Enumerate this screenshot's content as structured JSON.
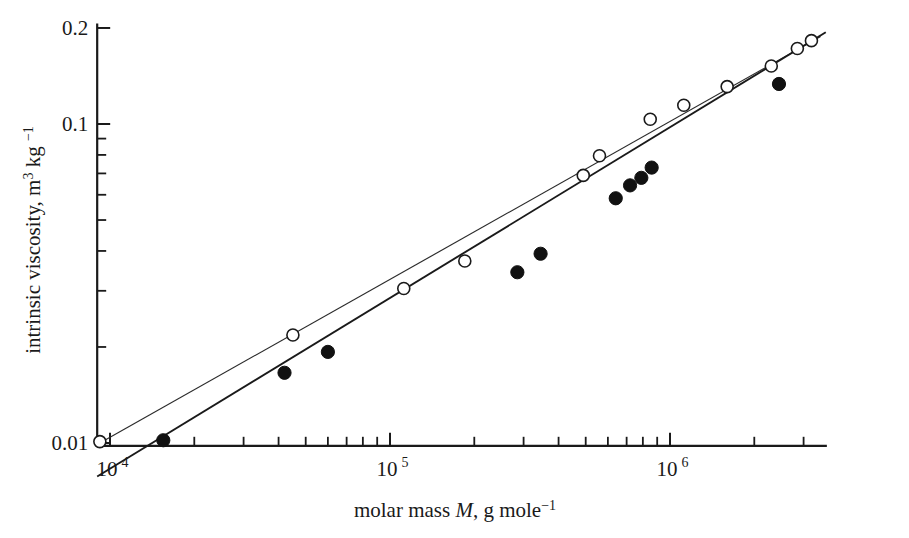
{
  "chart_data": {
    "type": "scatter",
    "title": "",
    "xlabel": "molar mass M, g mole⁻¹",
    "xlabel_parts": {
      "pre": "molar mass ",
      "symbol": "M",
      "mid": ", g mole",
      "sup": "−1"
    },
    "ylabel": "intrinsic viscosity, m³ kg ⁻¹",
    "ylabel_parts": {
      "pre": "intrinsic viscosity, m",
      "sup1": "3",
      "mid": " kg ",
      "sup2": "−1"
    },
    "xscale": "log",
    "yscale": "log",
    "xlim": [
      9000,
      3600000
    ],
    "ylim": [
      0.0098,
      0.205
    ],
    "grid": false,
    "legend": null,
    "x_tick_labels": [
      {
        "value": 10000,
        "text": "10",
        "sup": "4"
      },
      {
        "value": 100000,
        "text": "10",
        "sup": "5"
      },
      {
        "value": 1000000,
        "text": "10",
        "sup": "6"
      }
    ],
    "y_tick_labels": [
      {
        "value": 0.01,
        "text": "0.01"
      },
      {
        "value": 0.1,
        "text": "0.1"
      },
      {
        "value": 0.2,
        "text": "0.2"
      }
    ],
    "x_minor_ticks": [
      20000,
      30000,
      40000,
      50000,
      60000,
      70000,
      80000,
      90000,
      200000,
      300000,
      400000,
      500000,
      600000,
      700000,
      800000,
      900000,
      2000000,
      3000000
    ],
    "y_minor_ticks": [
      0.02,
      0.03,
      0.04,
      0.05,
      0.06,
      0.07,
      0.08,
      0.09
    ],
    "series": [
      {
        "name": "open-circles",
        "marker": "open-circle",
        "color": "#1a1a1a",
        "x": [
          9200,
          45000,
          112000,
          185000,
          490000,
          560000,
          850000,
          1120000,
          1600000,
          2300000,
          2850000,
          3200000
        ],
        "y": [
          0.0101,
          0.0218,
          0.0305,
          0.0372,
          0.069,
          0.0795,
          0.1035,
          0.1145,
          0.131,
          0.152,
          0.1725,
          0.1825
        ],
        "fit_line": {
          "x0": 9200,
          "y0": 0.01,
          "x1": 3450000,
          "y1": 0.188
        }
      },
      {
        "name": "filled-circles",
        "marker": "filled-circle",
        "color": "#111111",
        "x": [
          15500,
          42000,
          60000,
          285000,
          345000,
          640000,
          720000,
          790000,
          860000,
          2450000
        ],
        "y": [
          0.0102,
          0.0166,
          0.0193,
          0.0343,
          0.0392,
          0.0585,
          0.0642,
          0.0678,
          0.073,
          0.1335
        ],
        "fit_line": {
          "x0": 9000,
          "y0": 0.00785,
          "x1": 3600000,
          "y1": 0.194
        }
      }
    ]
  },
  "axes": {
    "x_label_text": "molar mass M, g mole⁻¹",
    "y_label_text": "intrinsic viscosity, m³ kg ⁻¹"
  }
}
